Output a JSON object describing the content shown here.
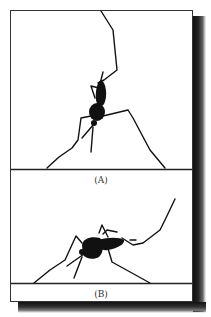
{
  "figure": {
    "panels": [
      {
        "id": "A",
        "label": "(A)",
        "description": "Insect silhouette hanging vertically with long legs spread, clinging to a line"
      },
      {
        "id": "B",
        "label": "(B)",
        "description": "Insect silhouette standing horizontally with long legs on a ground line"
      }
    ],
    "colors": {
      "line": "#111111",
      "frame": "#333333",
      "background": "#ffffff",
      "shadow": "#111111"
    }
  }
}
